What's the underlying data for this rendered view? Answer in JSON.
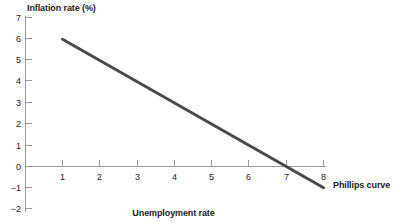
{
  "chart_data": {
    "type": "line",
    "title": "",
    "xlabel": "Unemployment rate",
    "ylabel": "Inflation rate (%)",
    "xlim": [
      0,
      8.6
    ],
    "ylim": [
      -2,
      7
    ],
    "grid": false,
    "legend_position": "inline-right",
    "x_ticks": [
      "1",
      "2",
      "3",
      "4",
      "5",
      "6",
      "7",
      "8"
    ],
    "x_tick_values": [
      1,
      2,
      3,
      4,
      5,
      6,
      7,
      8
    ],
    "y_ticks": [
      "7",
      "6",
      "5",
      "4",
      "3",
      "2",
      "1",
      "0",
      "−1",
      "−2"
    ],
    "y_tick_values": [
      7,
      6,
      5,
      4,
      3,
      2,
      1,
      0,
      -1,
      -2
    ],
    "series": [
      {
        "name": "Phillips curve",
        "color": "#4a4a4a",
        "x": [
          1,
          8
        ],
        "values": [
          6,
          -1
        ],
        "points": [
          {
            "x": 1,
            "y": 6
          },
          {
            "x": 2,
            "y": 5
          },
          {
            "x": 3,
            "y": 4
          },
          {
            "x": 4,
            "y": 3
          },
          {
            "x": 5,
            "y": 2
          },
          {
            "x": 6,
            "y": 1
          },
          {
            "x": 7,
            "y": 0
          },
          {
            "x": 8,
            "y": -1
          }
        ],
        "slope": -1,
        "x_intercept": 7
      }
    ],
    "annotations": [
      {
        "text": "Phillips curve",
        "x": 8.2,
        "y": -1
      }
    ],
    "axis_color": "#999999",
    "text_color": "#1a1a1a"
  },
  "labels": {
    "y_axis_title": "Inflation rate (%)",
    "x_axis_title": "Unemployment rate",
    "series_label": "Phillips curve"
  },
  "axis": {
    "y_tick_0": "7",
    "y_tick_1": "6",
    "y_tick_2": "5",
    "y_tick_3": "4",
    "y_tick_4": "3",
    "y_tick_5": "2",
    "y_tick_6": "1",
    "y_tick_7": "0",
    "y_tick_8": "−1",
    "y_tick_9": "−2",
    "x_tick_0": "1",
    "x_tick_1": "2",
    "x_tick_2": "3",
    "x_tick_3": "4",
    "x_tick_4": "5",
    "x_tick_5": "6",
    "x_tick_6": "7",
    "x_tick_7": "8"
  }
}
